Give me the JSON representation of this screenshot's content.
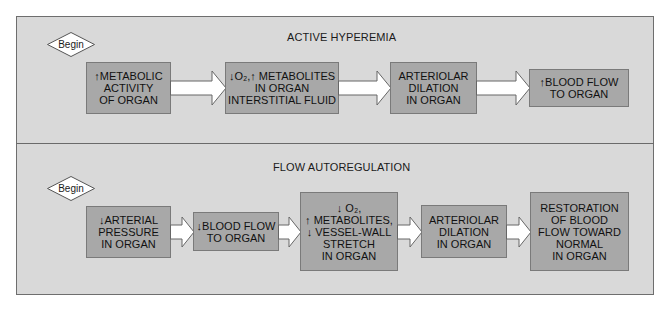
{
  "diagram": {
    "colors": {
      "panel_background": "#d9d9d9",
      "box_fill": "#a8a8a8",
      "box_border": "#7a7a7a",
      "arrow_fill": "#ffffff",
      "text": "#111111"
    },
    "panels": [
      {
        "title": "ACTIVE HYPEREMIA",
        "start_label": "Begin",
        "steps": [
          {
            "prefix": "↑",
            "text": "METABOLIC\nACTIVITY\nOF ORGAN"
          },
          {
            "prefix": "↓",
            "text": "O₂,↑ METABOLITES\nIN ORGAN\nINTERSTITIAL FLUID"
          },
          {
            "prefix": "",
            "text": "ARTERIOLAR\nDILATION\nIN ORGAN"
          },
          {
            "prefix": "↑",
            "text": "BLOOD FLOW\nTO ORGAN"
          }
        ]
      },
      {
        "title": "FLOW AUTOREGULATION",
        "start_label": "Begin",
        "steps": [
          {
            "prefix": "↓",
            "text": "ARTERIAL\nPRESSURE\nIN ORGAN"
          },
          {
            "prefix": "↓",
            "text": "BLOOD FLOW\nTO ORGAN"
          },
          {
            "prefix": "",
            "text": "↓ O₂,\n↑ METABOLITES,\n↓ VESSEL-WALL\nSTRETCH\nIN ORGAN"
          },
          {
            "prefix": "",
            "text": "ARTERIOLAR\nDILATION\nIN ORGAN"
          },
          {
            "prefix": "",
            "text": "RESTORATION\nOF BLOOD\nFLOW TOWARD\nNORMAL\nIN ORGAN"
          }
        ]
      }
    ]
  }
}
